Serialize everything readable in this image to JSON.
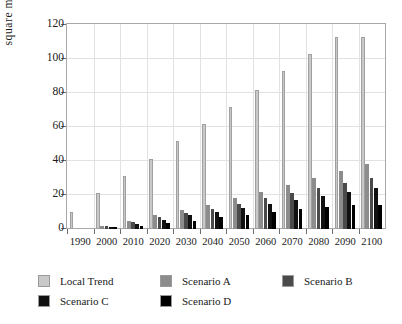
{
  "chart_data": {
    "type": "bar",
    "title": "",
    "subtitle": "",
    "xlabel": "",
    "ylabel": "square miles",
    "categories": [
      "1990",
      "2000",
      "2010",
      "2020",
      "2030",
      "2040",
      "2050",
      "2060",
      "2070",
      "2080",
      "2090",
      "2100"
    ],
    "series": [
      {
        "name": "Local Trend",
        "color": "#c9c9c9",
        "values": [
          10,
          21,
          31,
          41,
          52,
          62,
          72,
          82,
          93,
          103,
          113,
          113
        ]
      },
      {
        "name": "Scenario A",
        "color": "#8c8c8c",
        "values": [
          0,
          2,
          5,
          8,
          11,
          14,
          18,
          22,
          26,
          30,
          34,
          38
        ]
      },
      {
        "name": "Scenario B",
        "color": "#4a4a4a",
        "values": [
          0,
          1.5,
          4,
          7,
          9.5,
          12,
          15,
          18,
          21,
          24,
          27,
          30
        ]
      },
      {
        "name": "Scenario C",
        "color": "#111111",
        "values": [
          0,
          1.2,
          3,
          5.5,
          8,
          10,
          12.5,
          15,
          17,
          19.5,
          22,
          24
        ]
      },
      {
        "name": "Scenario D",
        "color": "#000000",
        "values": [
          0,
          1,
          2,
          3.5,
          5,
          7,
          8.5,
          10,
          12,
          13,
          14,
          14
        ]
      }
    ],
    "ylim": [
      0,
      120
    ],
    "yticks": [
      0,
      20,
      40,
      60,
      80,
      100,
      120
    ],
    "grid": true,
    "legend_position": "bottom",
    "legend_entries": [
      "Local Trend",
      "Scenario A",
      "Scenario B",
      "Scenario C",
      "Scenario D"
    ]
  }
}
